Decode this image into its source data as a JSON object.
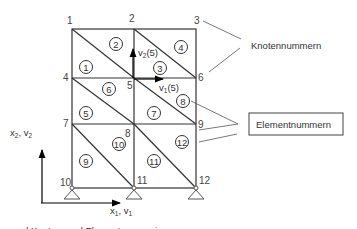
{
  "diagram": {
    "caption_partial": "... und Knoten- und Elementnummerierung",
    "labels": {
      "nodes_callout": "Knotennummern",
      "elements_callout": "Elementnummern",
      "dof_v1": "v",
      "dof_v1_sub": "1",
      "dof_v1_arg": "(5)",
      "dof_v2": "v",
      "dof_v2_sub": "2",
      "dof_v2_arg": "(5)",
      "axis_x_main": "x",
      "axis_x_sub": "1",
      "axis_x_rest": ", v",
      "axis_x_sub2": "1",
      "axis_y_main": "x",
      "axis_y_sub": "2",
      "axis_y_rest": ", v",
      "axis_y_sub2": "2"
    },
    "nodes": [
      {
        "id": "1",
        "label": "1"
      },
      {
        "id": "2",
        "label": "2"
      },
      {
        "id": "3",
        "label": "3"
      },
      {
        "id": "4",
        "label": "4"
      },
      {
        "id": "5",
        "label": "5"
      },
      {
        "id": "6",
        "label": "6"
      },
      {
        "id": "7",
        "label": "7"
      },
      {
        "id": "8",
        "label": "8"
      },
      {
        "id": "9",
        "label": "9"
      },
      {
        "id": "10",
        "label": "10"
      },
      {
        "id": "11",
        "label": "11"
      },
      {
        "id": "12",
        "label": "12"
      }
    ],
    "elements": [
      {
        "label": "1"
      },
      {
        "label": "2"
      },
      {
        "label": "3"
      },
      {
        "label": "4"
      },
      {
        "label": "5"
      },
      {
        "label": "6"
      },
      {
        "label": "7"
      },
      {
        "label": "8"
      },
      {
        "label": "9"
      },
      {
        "label": "10"
      },
      {
        "label": "11"
      },
      {
        "label": "12"
      }
    ],
    "supports": [
      "10",
      "11",
      "12"
    ]
  }
}
